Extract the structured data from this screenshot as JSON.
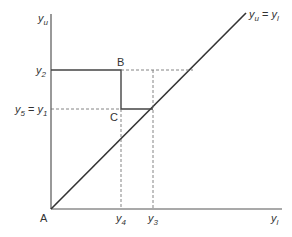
{
  "diagram": {
    "axes": {
      "y_label": "y",
      "y_label_sub": "u",
      "x_label": "y",
      "x_label_sub": "l",
      "origin_label": "A"
    },
    "ticks_y": [
      {
        "base": "y",
        "sub": "2",
        "suffix": ""
      },
      {
        "base": "y",
        "sub": "5",
        "mid": " = ",
        "base2": "y",
        "sub2": "1"
      }
    ],
    "ticks_x": [
      {
        "base": "y",
        "sub": "4"
      },
      {
        "base": "y",
        "sub": "3"
      }
    ],
    "points": {
      "B": "B",
      "C": "C"
    },
    "line_label": {
      "left_base": "y",
      "left_sub": "u",
      "eq": " = ",
      "right_base": "y",
      "right_sub": "l"
    },
    "colors": {
      "line": "#333333",
      "dashed": "#555555"
    }
  }
}
